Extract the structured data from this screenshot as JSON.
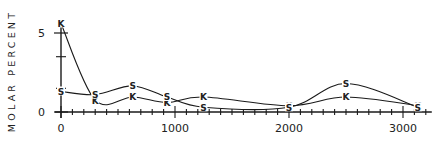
{
  "chart_data": {
    "type": "line",
    "title": "",
    "xlabel": "",
    "ylabel": "MOLAR PERCENT",
    "xlim": [
      0,
      3200
    ],
    "ylim": [
      0,
      5.5
    ],
    "x_ticks": [
      0,
      1000,
      2000,
      3000
    ],
    "x_tick_labels": [
      "0",
      "1000",
      "2000",
      "3000"
    ],
    "x_minor_tick_step": 100,
    "y_ticks": [
      0,
      5
    ],
    "y_tick_labels": [
      "0",
      "5"
    ],
    "y_minor_ticks": [
      1.5,
      3.5
    ],
    "grid": false,
    "legend": "inline markers",
    "series": [
      {
        "name": "K",
        "marker": "K",
        "x": [
          0,
          300,
          630,
          930,
          1250,
          2000,
          2500,
          3130
        ],
        "values": [
          5.6,
          0.75,
          0.95,
          0.6,
          0.95,
          0.4,
          0.95,
          0.4
        ]
      },
      {
        "name": "S",
        "marker": "S",
        "x": [
          0,
          300,
          630,
          930,
          1250,
          2000,
          2500,
          3130
        ],
        "values": [
          1.3,
          1.1,
          1.65,
          0.95,
          0.3,
          0.3,
          1.8,
          0.3
        ]
      }
    ]
  }
}
